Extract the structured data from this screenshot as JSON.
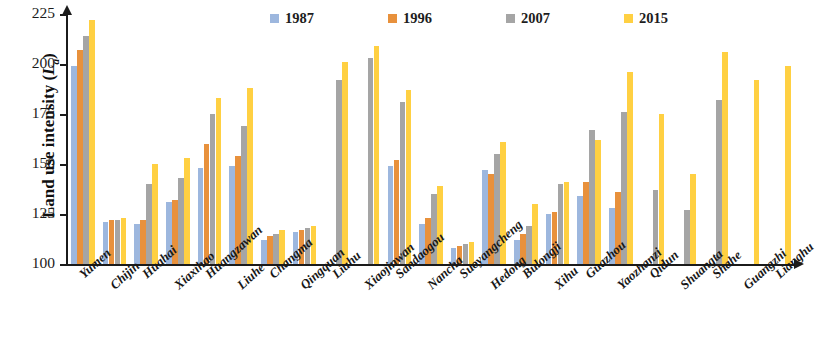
{
  "chart_data": {
    "type": "bar",
    "title": "",
    "xlabel": "",
    "ylabel": "Land use intensity (La)",
    "ylabel_main": "Land use intensity (",
    "ylabel_sym": "L",
    "ylabel_sub": "a",
    "ylabel_close": ")",
    "ylim": [
      100,
      225
    ],
    "yticks": [
      225,
      200,
      175,
      150,
      125,
      100
    ],
    "grid": false,
    "legend_position": "top",
    "categories": [
      "Yumen",
      "Chijin",
      "Huahai",
      "Xiaxihao",
      "Huangzawan",
      "Liuhe",
      "Changma",
      "Qingquan",
      "Liuhu",
      "Xiaojinwan",
      "Sandaogou",
      "Nancha",
      "Suoyangcheng",
      "Hedong",
      "Bulongji",
      "Xihu",
      "Guazhou",
      "Yaozhanzi",
      "Qidun",
      "Shuangta",
      "Shahe",
      "Guangzhi",
      "Lianghu"
    ],
    "series": [
      {
        "name": "1987",
        "color": "#9DB7DE",
        "values": [
          199,
          121,
          120,
          131,
          148,
          149,
          112,
          116,
          null,
          null,
          149,
          120,
          108,
          147,
          112,
          125,
          134,
          128,
          null,
          null,
          null,
          null,
          null
        ]
      },
      {
        "name": "1996",
        "color": "#E8913C",
        "values": [
          207,
          122,
          122,
          132,
          160,
          154,
          114,
          117,
          null,
          null,
          152,
          123,
          109,
          145,
          115,
          126,
          141,
          136,
          null,
          null,
          null,
          null,
          null
        ]
      },
      {
        "name": "2007",
        "color": "#A5A5A5",
        "values": [
          214,
          122,
          140,
          143,
          175,
          169,
          115,
          118,
          192,
          203,
          181,
          135,
          110,
          155,
          119,
          140,
          167,
          176,
          137,
          127,
          182,
          null,
          null
        ]
      },
      {
        "name": "2015",
        "color": "#FFD042",
        "values": [
          222,
          123,
          150,
          153,
          183,
          188,
          117,
          119,
          201,
          209,
          187,
          139,
          111,
          161,
          130,
          141,
          162,
          196,
          175,
          145,
          206,
          192,
          199
        ]
      }
    ]
  },
  "legend": {
    "items": [
      {
        "label": "1987",
        "color": "#9DB7DE"
      },
      {
        "label": "1996",
        "color": "#E8913C"
      },
      {
        "label": "2007",
        "color": "#A5A5A5"
      },
      {
        "label": "2015",
        "color": "#FFD042"
      }
    ]
  }
}
